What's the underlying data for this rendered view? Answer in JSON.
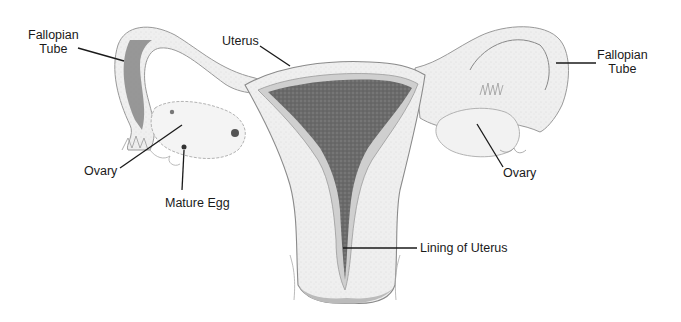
{
  "diagram": {
    "type": "anatomical illustration (pencil drawing)",
    "labels": {
      "fallopian_tube_left": {
        "line1": "Fallopian",
        "line2": "Tube"
      },
      "uterus": "Uterus",
      "ovary_left": "Ovary",
      "mature_egg": "Mature Egg",
      "fallopian_tube_right": {
        "line1": "Fallopian",
        "line2": "Tube"
      },
      "ovary_right": "Ovary",
      "lining_of_uterus": "Lining of Uterus"
    },
    "colors": {
      "background": "#ffffff",
      "outline": "#8a8a8a",
      "tissue_light": "#ececec",
      "tissue_mid": "#cfcfcf",
      "lining_dark": "#6e6e6e",
      "leader_line": "#1a1a1a",
      "text": "#1a1a1a"
    }
  }
}
